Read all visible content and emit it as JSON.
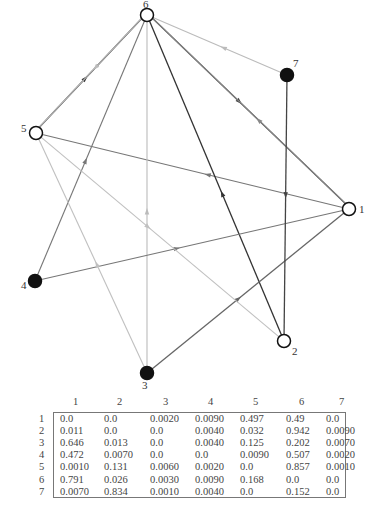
{
  "graph": {
    "nodes": [
      {
        "id": "1",
        "label": "1",
        "x": 349,
        "y": 209,
        "filled": false,
        "label_dx": 10,
        "label_dy": 4
      },
      {
        "id": "2",
        "label": "2",
        "x": 284,
        "y": 341,
        "filled": false,
        "label_dx": 8,
        "label_dy": 14
      },
      {
        "id": "3",
        "label": "3",
        "x": 147,
        "y": 373,
        "filled": true,
        "label_dx": -5,
        "label_dy": 16
      },
      {
        "id": "4",
        "label": "4",
        "x": 35,
        "y": 281,
        "filled": true,
        "label_dx": -14,
        "label_dy": 8
      },
      {
        "id": "5",
        "label": "5",
        "x": 36,
        "y": 133,
        "filled": false,
        "label_dx": -15,
        "label_dy": -1
      },
      {
        "id": "6",
        "label": "6",
        "x": 147,
        "y": 15,
        "filled": false,
        "label_dx": -4,
        "label_dy": -7
      },
      {
        "id": "7",
        "label": "7",
        "x": 287,
        "y": 75,
        "filled": true,
        "label_dx": 6,
        "label_dy": -8
      }
    ],
    "edges": [
      {
        "from": "5",
        "to": "6",
        "weight": 0.857,
        "color": "#333333",
        "offset": -1.5
      },
      {
        "from": "6",
        "to": "5",
        "weight": 0.168,
        "color": "#bbbbbb",
        "offset": 1.5
      },
      {
        "from": "6",
        "to": "1",
        "weight": 0.791,
        "color": "#444444",
        "offset": -1.5
      },
      {
        "from": "1",
        "to": "6",
        "weight": 0.49,
        "color": "#888888",
        "offset": 1.5
      },
      {
        "from": "1",
        "to": "5",
        "weight": 0.497,
        "color": "#777777",
        "offset": 0
      },
      {
        "from": "2",
        "to": "6",
        "weight": 0.942,
        "color": "#333333",
        "offset": 0
      },
      {
        "from": "3",
        "to": "1",
        "weight": 0.646,
        "color": "#666666",
        "offset": 0
      },
      {
        "from": "3",
        "to": "6",
        "weight": 0.202,
        "color": "#bbbbbb",
        "offset": 0
      },
      {
        "from": "4",
        "to": "1",
        "weight": 0.472,
        "color": "#777777",
        "offset": 0
      },
      {
        "from": "4",
        "to": "6",
        "weight": 0.507,
        "color": "#777777",
        "offset": 0
      },
      {
        "from": "7",
        "to": "2",
        "weight": 0.834,
        "color": "#444444",
        "offset": 0
      },
      {
        "from": "7",
        "to": "6",
        "weight": 0.152,
        "color": "#bbbbbb",
        "offset": 0
      },
      {
        "from": "5",
        "to": "2",
        "weight": 0.131,
        "color": "#c0c0c0",
        "offset": 0
      },
      {
        "from": "3",
        "to": "5",
        "weight": 0.125,
        "color": "#c0c0c0",
        "offset": 0
      }
    ]
  },
  "matrix": {
    "column_headers": [
      "1",
      "2",
      "3",
      "4",
      "5",
      "6",
      "7"
    ],
    "row_headers": [
      "1",
      "2",
      "3",
      "4",
      "5",
      "6",
      "7"
    ],
    "rows": [
      [
        "0.0",
        "0.0",
        "0.0020",
        "0.0090",
        "0.497",
        "0.49",
        "0.0"
      ],
      [
        "0.011",
        "0.0",
        "0.0",
        "0.0040",
        "0.032",
        "0.942",
        "0.0090"
      ],
      [
        "0.646",
        "0.013",
        "0.0",
        "0.0040",
        "0.125",
        "0.202",
        "0.0070"
      ],
      [
        "0.472",
        "0.0070",
        "0.0",
        "0.0",
        "0.0090",
        "0.507",
        "0.0020"
      ],
      [
        "0.0010",
        "0.131",
        "0.0060",
        "0.0020",
        "0.0",
        "0.857",
        "0.0010"
      ],
      [
        "0.791",
        "0.026",
        "0.0030",
        "0.0090",
        "0.168",
        "0.0",
        "0.0"
      ],
      [
        "0.0070",
        "0.834",
        "0.0010",
        "0.0040",
        "0.0",
        "0.152",
        "0.0"
      ]
    ]
  }
}
